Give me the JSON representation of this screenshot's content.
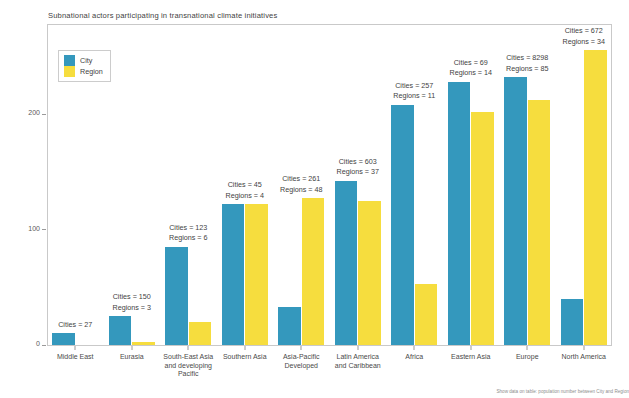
{
  "chart_data": {
    "type": "bar",
    "title": "Subnational actors participating in transnational climate initiatives",
    "xlabel": "",
    "ylabel": "Population (in millions)",
    "ylim": [
      0,
      280
    ],
    "yticks": [
      0,
      100,
      200
    ],
    "ytick_labels": [
      "0",
      "100",
      "200"
    ],
    "grid": false,
    "legend_position": "upper-left",
    "categories": [
      "Middle East",
      "Eurasia",
      "South-East Asia\nand developing\nPacific",
      "Southern Asia",
      "Asia-Pacific\nDeveloped",
      "Latin America\nand Caribbean",
      "Africa",
      "Eastern Asia",
      "Europe",
      "North America"
    ],
    "series": [
      {
        "name": "City",
        "color": "#3498bd",
        "values": [
          10,
          25,
          85,
          122,
          33,
          142,
          208,
          228,
          232,
          40
        ]
      },
      {
        "name": "Region",
        "color": "#f6dd3e",
        "values": [
          0,
          3,
          20,
          122,
          127,
          125,
          53,
          202,
          212,
          255
        ]
      }
    ],
    "annotations": [
      {
        "cities": "Cities = 27",
        "regions": ""
      },
      {
        "cities": "Cities = 150",
        "regions": "Regions = 3"
      },
      {
        "cities": "Cities = 123",
        "regions": "Regions = 6"
      },
      {
        "cities": "Cities = 45",
        "regions": "Regions = 4"
      },
      {
        "cities": "Cities = 261",
        "regions": "Regions = 48"
      },
      {
        "cities": "Cities = 603",
        "regions": "Regions = 37"
      },
      {
        "cities": "Cities = 257",
        "regions": "Regions = 11"
      },
      {
        "cities": "Cities = 69",
        "regions": "Regions = 14"
      },
      {
        "cities": "Cities = 8298",
        "regions": "Regions = 85"
      },
      {
        "cities": "Cities = 672",
        "regions": "Regions = 34"
      }
    ]
  },
  "legend": {
    "items": [
      {
        "label": "City",
        "color": "#3498bd"
      },
      {
        "label": "Region",
        "color": "#f6dd3e"
      }
    ]
  },
  "footnote": {
    "text": "Show data on table: population number between City and Region"
  }
}
